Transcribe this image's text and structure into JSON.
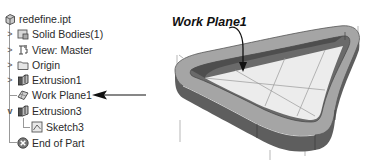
{
  "browser": {
    "root": {
      "label": "redefine.ipt",
      "icon": "part-icon"
    },
    "items": [
      {
        "label": "Solid Bodies(1)",
        "icon": "solid-bodies-icon",
        "expander": ">"
      },
      {
        "label": "View: Master",
        "icon": "view-icon",
        "expander": ">"
      },
      {
        "label": "Origin",
        "icon": "folder-icon",
        "expander": ">"
      },
      {
        "label": "Extrusion1",
        "icon": "extrusion-icon",
        "expander": ">"
      },
      {
        "label": "Work Plane1",
        "icon": "work-plane-icon",
        "expander": ""
      },
      {
        "label": "Extrusion3",
        "icon": "extrusion-icon",
        "expander": "v"
      },
      {
        "label": "Sketch3",
        "icon": "sketch-icon",
        "expander": ""
      },
      {
        "label": "End of Part",
        "icon": "end-of-part-icon",
        "expander": ""
      }
    ]
  },
  "annotation": {
    "callout_label": "Work Plane1"
  },
  "colors": {
    "model_dark": "#5a5a5a",
    "model_mid": "#8c8c8c",
    "model_light": "#b8b8b8",
    "plane_fill": "#ededed",
    "arrow": "#111111"
  }
}
